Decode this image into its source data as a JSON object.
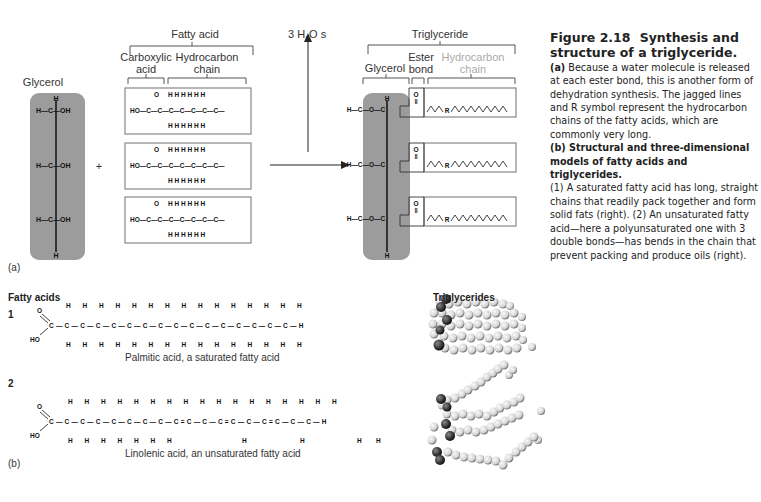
{
  "part_a": {
    "panel_label": "(a)",
    "glycerol": {
      "label": "Glycerol",
      "rows": [
        "H—C—OH",
        "H—C—OH",
        "H—C—OH"
      ],
      "top_h": "H",
      "bottom_h": "H"
    },
    "plus_sign": "+",
    "fatty_acid": {
      "label": "Fatty acid",
      "carboxylic_label": "Carboxylic acid",
      "hydrocarbon_label": "Hydrocarbon chain",
      "formula_prefix": "HO",
      "box_count": 3
    },
    "water_release": "3 H2O s",
    "triglyceride": {
      "label": "Triglyceride",
      "glycerol_label": "Glycerol",
      "ester_label": "Ester bond",
      "hydrocarbon_label": "Hydrocarbon chain",
      "r_symbol": "R"
    }
  },
  "part_b": {
    "panel_label": "(b)",
    "fatty_acids_header": "Fatty acids",
    "triglycerides_header": "Triglycerides",
    "item1": {
      "number": "1",
      "caption": "Palmitic acid, a saturated fatty acid"
    },
    "item2": {
      "number": "2",
      "caption": "Linolenic acid, an unsaturated fatty acid"
    }
  },
  "caption": {
    "figure_number": "Figure 2.18",
    "title": "Synthesis and structure of a triglyceride.",
    "a_label": "(a)",
    "a_text": "Because a water molecule is released at each ester bond, this is another form of dehydration synthesis. The jagged lines and R symbol represent the hydrocarbon chains of the fatty acids, which are commonly very long.",
    "b_label": "(b) Structural and three-dimensional models of fatty acids and triglycerides.",
    "b_text": "(1) A saturated fatty acid has long, straight chains that readily pack together and form solid fats (right). (2) An unsaturated fatty acid—here a polyunsaturated one with 3 double bonds—has bends in the chain that prevent packing and produce oils (right)."
  }
}
